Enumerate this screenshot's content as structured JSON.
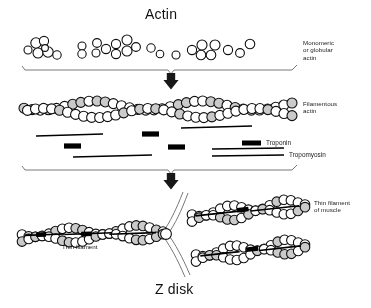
{
  "diagram": {
    "title": "Actin",
    "bottom_title": "Z disk",
    "labels": {
      "monomeric": "Monomeric\nor globular\nactin",
      "filamentous": "Filamentous\nactin",
      "thin_filament": "Thin filament",
      "thin_filament_muscle": "Thin filament\nof muscle"
    },
    "legend": [
      {
        "key": "troponin",
        "label": "Troponin",
        "swatch": "thick-bar",
        "color": "#000000"
      },
      {
        "key": "tropomyosin",
        "label": "Tropomyosin",
        "swatch": "thin-line",
        "color": "#000000"
      }
    ],
    "colors": {
      "ink": "#111111",
      "bead_fill_light": "#ffffff",
      "bead_fill_shaded": "#c9c9c9",
      "bar": "#000000",
      "brace": "#555555"
    },
    "stages": [
      {
        "name": "monomeric-actin",
        "description": "scattered globular actin monomers"
      },
      {
        "name": "filamentous-actin",
        "description": "two intertwined strands of polymerized actin beads"
      },
      {
        "name": "thin-filament",
        "description": "filaments joined at the Z disk"
      }
    ],
    "monomers": [
      {
        "cx": 28,
        "cy": 50,
        "r": 4.0
      },
      {
        "cx": 36,
        "cy": 43,
        "r": 5.2
      },
      {
        "cx": 44,
        "cy": 41,
        "r": 4.6
      },
      {
        "cx": 38,
        "cy": 53,
        "r": 5.0
      },
      {
        "cx": 48,
        "cy": 52,
        "r": 5.2
      },
      {
        "cx": 57,
        "cy": 55,
        "r": 4.2
      },
      {
        "cx": 45,
        "cy": 48,
        "r": 3.4
      },
      {
        "cx": 82,
        "cy": 46,
        "r": 4.0
      },
      {
        "cx": 82,
        "cy": 54,
        "r": 4.2
      },
      {
        "cx": 97,
        "cy": 43,
        "r": 4.4
      },
      {
        "cx": 96,
        "cy": 53,
        "r": 4.0
      },
      {
        "cx": 106,
        "cy": 49,
        "r": 4.6
      },
      {
        "cx": 116,
        "cy": 44,
        "r": 4.6
      },
      {
        "cx": 116,
        "cy": 54,
        "r": 4.6
      },
      {
        "cx": 127,
        "cy": 40,
        "r": 5.0
      },
      {
        "cx": 127,
        "cy": 51,
        "r": 5.0
      },
      {
        "cx": 136,
        "cy": 47,
        "r": 4.4
      },
      {
        "cx": 151,
        "cy": 48,
        "r": 4.2
      },
      {
        "cx": 160,
        "cy": 54,
        "r": 3.8
      },
      {
        "cx": 176,
        "cy": 55,
        "r": 4.0
      },
      {
        "cx": 192,
        "cy": 50,
        "r": 4.6
      },
      {
        "cx": 202,
        "cy": 45,
        "r": 5.0
      },
      {
        "cx": 201,
        "cy": 55,
        "r": 4.8
      },
      {
        "cx": 211,
        "cy": 55,
        "r": 4.8
      },
      {
        "cx": 215,
        "cy": 45,
        "r": 5.0
      },
      {
        "cx": 228,
        "cy": 50,
        "r": 4.6
      },
      {
        "cx": 240,
        "cy": 53,
        "r": 4.4
      },
      {
        "cx": 250,
        "cy": 44,
        "r": 4.8
      }
    ],
    "overlay_bars": [
      {
        "type": "tropomyosin",
        "x1": 36,
        "y1": 136,
        "x2": 103,
        "y2": 134
      },
      {
        "type": "tropomyosin",
        "x1": 73,
        "y1": 157,
        "x2": 152,
        "y2": 155
      },
      {
        "type": "tropomyosin",
        "x1": 181,
        "y1": 128,
        "x2": 252,
        "y2": 126
      },
      {
        "type": "tropomyosin",
        "x1": 212,
        "y1": 149,
        "x2": 284,
        "y2": 148
      },
      {
        "type": "troponin",
        "x1": 64,
        "y1": 146,
        "x2": 81,
        "y2": 146
      },
      {
        "type": "troponin",
        "x1": 142,
        "y1": 134,
        "x2": 159,
        "y2": 134
      },
      {
        "type": "troponin",
        "x1": 168,
        "y1": 147,
        "x2": 185,
        "y2": 147
      }
    ]
  }
}
